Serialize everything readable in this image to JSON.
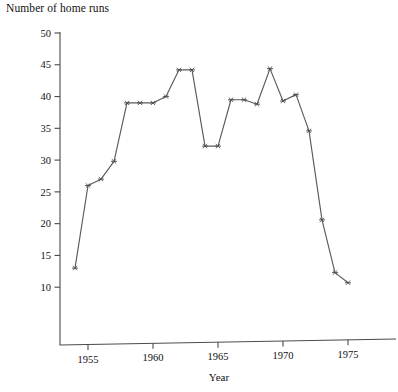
{
  "chart_data": {
    "type": "line",
    "title": "",
    "ylabel": "Number of home runs",
    "xlabel": "Year",
    "x": [
      1954,
      1955,
      1956,
      1957,
      1958,
      1959,
      1960,
      1961,
      1962,
      1963,
      1964,
      1965,
      1966,
      1967,
      1968,
      1969,
      1970,
      1971,
      1972,
      1973,
      1974,
      1975
    ],
    "values": [
      13,
      26,
      27,
      29.8,
      39,
      39,
      39,
      40,
      44.2,
      44.2,
      32.2,
      32.2,
      39.5,
      39.5,
      38.8,
      44.4,
      39.3,
      40.3,
      34.6,
      20.6,
      12.3,
      10.7
    ],
    "series": [
      {
        "name": "Number of home runs",
        "values": [
          13,
          26,
          27,
          29.8,
          39,
          39,
          39,
          40,
          44.2,
          44.2,
          32.2,
          32.2,
          39.5,
          39.5,
          38.8,
          44.4,
          39.3,
          40.3,
          34.6,
          20.6,
          12.3,
          10.7
        ]
      }
    ],
    "xlim": [
      1953.2,
      1976.5
    ],
    "ylim": [
      5.0,
      50
    ],
    "xticks": [
      1955,
      1960,
      1965,
      1970,
      1975
    ],
    "xtick_labels": [
      "1955",
      "1960",
      "1965",
      "1970",
      "1975"
    ],
    "yticks": [
      10,
      15,
      20,
      25,
      30,
      35,
      40,
      45,
      50
    ],
    "ytick_labels": [
      "10",
      "15",
      "20",
      "25",
      "30",
      "35",
      "40",
      "45",
      "50"
    ],
    "grid": false,
    "legend": false,
    "marker": "asterisk",
    "line_color": "#5a5a5a",
    "marker_color": "#4d4d4d",
    "axis_color": "#4a4a4a",
    "background_color": "#ffffff"
  },
  "labels": {
    "y_axis_title": "Number of home runs",
    "x_axis_title": "Year"
  }
}
